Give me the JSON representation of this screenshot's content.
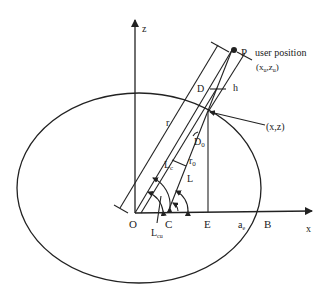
{
  "diagram": {
    "type": "geometry",
    "axes": {
      "x_label": "x",
      "z_label": "z"
    },
    "points": {
      "origin": "O",
      "center_c": "C",
      "foot_e": "E",
      "equator_b": "B",
      "user": "P"
    },
    "labels": {
      "user_position": "user position",
      "user_coords": "(x",
      "user_coords_sub1": "u",
      "user_coords_mid": ",z",
      "user_coords_sub2": "u",
      "user_coords_end": ")",
      "surface_point": "(x,z)",
      "r": "r",
      "r0": "r",
      "r0_sub": "0",
      "D": "D",
      "D0": "D",
      "D0_sub": "0",
      "h": "h",
      "Lc": "L",
      "Lc_sub": "c",
      "L": "L",
      "Lcu": "L",
      "Lcu_sub": "cu",
      "ae": "a",
      "ae_sub": "e"
    },
    "colors": {
      "stroke": "#222222",
      "background": "#ffffff"
    }
  }
}
